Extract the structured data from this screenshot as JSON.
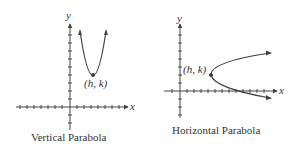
{
  "figures": [
    {
      "id": "vertical",
      "caption": "Vertical Parabola",
      "x_axis_label": "x",
      "y_axis_label": "y",
      "vertex_label": "(h, k)",
      "opens": "up"
    },
    {
      "id": "horizontal",
      "caption": "Horizontal Parabola",
      "x_axis_label": "x",
      "y_axis_label": "y",
      "vertex_label": "(h, k)",
      "opens": "right"
    }
  ],
  "colors": {
    "stroke": "#444444",
    "text": "#333333"
  }
}
